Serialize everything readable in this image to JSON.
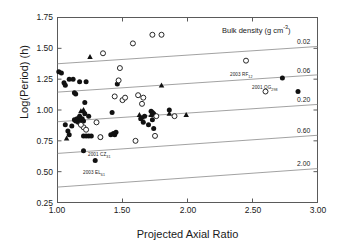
{
  "axes": {
    "xlabel": "Projected Axial Ratio",
    "ylabel": "Log(Period) (h)",
    "xticks": [
      "1.00",
      "1.50",
      "2.00",
      "2.50",
      "3.00"
    ],
    "yticks": [
      "1.75",
      "1.50",
      "1.25",
      "1.00",
      "0.75",
      "0.50",
      "0.25"
    ]
  },
  "density_header": "Bulk density (g cm",
  "density_header_exp": "-3",
  "density_header_close": ")",
  "density_labels": [
    "0.02",
    "0.06",
    "0.20",
    "0.60",
    "2.00"
  ],
  "annotations": [
    {
      "name": "2003 RF",
      "sub": "12"
    },
    {
      "name": "2001 QG",
      "sub": "298"
    },
    {
      "name": "2001 CZ",
      "sub": "31"
    },
    {
      "name": "2003 EL",
      "sub": "61"
    }
  ],
  "chart_data": {
    "type": "scatter",
    "title": "",
    "xlabel": "Projected Axial Ratio",
    "ylabel": "Log(Period) (h)",
    "xlim": [
      1.0,
      3.0
    ],
    "ylim": [
      0.25,
      1.75
    ],
    "xtick_values": [
      1.0,
      1.5,
      2.0,
      2.5,
      3.0
    ],
    "ytick_values": [
      0.25,
      0.5,
      0.75,
      1.0,
      1.25,
      1.5,
      1.75
    ],
    "grid": false,
    "legend": "none",
    "series": [
      {
        "name": "filled-circle",
        "marker": "filled circle",
        "color": "#111111",
        "points": [
          [
            1.01,
            1.31
          ],
          [
            1.03,
            1.3
          ],
          [
            1.05,
            1.22
          ],
          [
            1.06,
            1.2
          ],
          [
            1.09,
            1.25
          ],
          [
            1.12,
            1.25
          ],
          [
            1.13,
            1.14
          ],
          [
            1.14,
            1.13
          ],
          [
            1.11,
            0.87
          ],
          [
            1.08,
            0.83
          ],
          [
            1.06,
            0.88
          ],
          [
            1.09,
            0.8
          ],
          [
            1.13,
            0.92
          ],
          [
            1.14,
            0.91
          ],
          [
            1.15,
            0.93
          ],
          [
            1.16,
            0.9
          ],
          [
            1.17,
            0.95
          ],
          [
            1.18,
            0.92
          ],
          [
            1.19,
            0.93
          ],
          [
            1.2,
            0.91
          ],
          [
            1.21,
            0.97
          ],
          [
            1.17,
            1.23
          ],
          [
            1.22,
            1.23
          ],
          [
            1.21,
            1.06
          ],
          [
            1.24,
            0.95
          ],
          [
            1.2,
            0.79
          ],
          [
            1.22,
            0.79
          ],
          [
            1.24,
            0.79
          ],
          [
            1.26,
            0.79
          ],
          [
            1.2,
            0.67
          ],
          [
            1.29,
            0.59
          ],
          [
            1.33,
            0.78
          ],
          [
            1.41,
            0.8
          ],
          [
            1.43,
            0.81
          ],
          [
            1.44,
            0.8
          ],
          [
            1.45,
            0.82
          ],
          [
            1.46,
            1.21
          ],
          [
            1.42,
            0.98
          ],
          [
            1.64,
            0.93
          ],
          [
            1.66,
            0.9
          ],
          [
            1.67,
            0.95
          ],
          [
            1.72,
            0.99
          ],
          [
            1.73,
            0.98
          ],
          [
            1.74,
            0.97
          ],
          [
            1.73,
            0.92
          ],
          [
            1.74,
            0.85
          ],
          [
            1.7,
            0.88
          ],
          [
            1.86,
            1.0
          ],
          [
            2.73,
            1.26
          ],
          [
            2.85,
            1.15
          ]
        ]
      },
      {
        "name": "open-circle",
        "marker": "open circle",
        "color": "#111111",
        "points": [
          [
            1.2,
            0.86
          ],
          [
            1.22,
            0.84
          ],
          [
            1.18,
            0.88
          ],
          [
            1.3,
            0.9
          ],
          [
            1.33,
            0.78
          ],
          [
            1.35,
            1.46
          ],
          [
            1.44,
            1.11
          ],
          [
            1.47,
            1.24
          ],
          [
            1.48,
            1.34
          ],
          [
            1.5,
            1.08
          ],
          [
            1.52,
            1.1
          ],
          [
            1.58,
            1.54
          ],
          [
            1.6,
            0.75
          ],
          [
            1.62,
            1.12
          ],
          [
            1.65,
            1.05
          ],
          [
            1.66,
            1.1
          ],
          [
            1.73,
            1.61
          ],
          [
            1.8,
            1.61
          ],
          [
            1.75,
            0.79
          ],
          [
            1.76,
            0.95
          ],
          [
            1.9,
            0.95
          ],
          [
            2.45,
            1.4
          ],
          [
            2.6,
            1.15
          ]
        ]
      },
      {
        "name": "filled-triangle",
        "marker": "filled triangle",
        "color": "#111111",
        "points": [
          [
            1.07,
            0.77
          ],
          [
            1.18,
            0.99
          ],
          [
            1.2,
            1.0
          ],
          [
            1.25,
            1.43
          ],
          [
            1.63,
            0.96
          ],
          [
            1.65,
            0.94
          ],
          [
            1.72,
            0.96
          ],
          [
            1.8,
            1.2
          ],
          [
            1.86,
            0.97
          ],
          [
            1.99,
            0.96
          ]
        ]
      }
    ],
    "density_curves": [
      {
        "label": "0.02",
        "points": [
          [
            1.0,
            1.375
          ],
          [
            3.0,
            1.515
          ]
        ]
      },
      {
        "label": "0.06",
        "points": [
          [
            1.0,
            1.145
          ],
          [
            3.0,
            1.285
          ]
        ]
      },
      {
        "label": "0.20",
        "points": [
          [
            1.0,
            0.905
          ],
          [
            3.0,
            1.045
          ]
        ]
      },
      {
        "label": "0.60",
        "points": [
          [
            1.0,
            0.648
          ],
          [
            3.0,
            0.795
          ]
        ]
      },
      {
        "label": "2.00",
        "points": [
          [
            1.0,
            0.375
          ],
          [
            3.0,
            0.525
          ]
        ]
      }
    ]
  }
}
